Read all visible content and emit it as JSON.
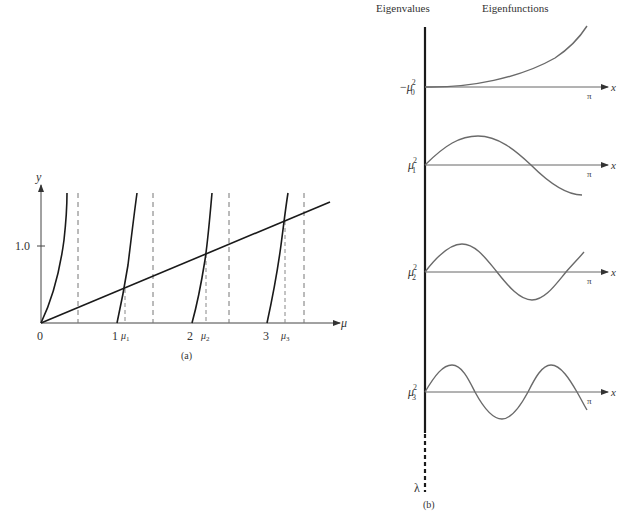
{
  "panel_a": {
    "caption": "(a)",
    "axis": {
      "x_label": "μ",
      "y_label": "y",
      "y_tick": "1.0"
    },
    "x_ticks": [
      "0",
      "1",
      "2",
      "3"
    ],
    "roots": [
      "μ1",
      "μ2",
      "μ3"
    ],
    "line_label": "y = μ/3 (straight line)",
    "curves": "y = tan(πμ) branches with vertical asymptotes at μ = 0.5, 1.5, 2.5, 3.5"
  },
  "panel_b": {
    "caption": "(b)",
    "header_eigenvalues": "Eigenvalues",
    "header_eigenfunctions": "Eigenfunctions",
    "axis_label_lambda": "λ",
    "rows": [
      {
        "eigenvalue": "−μ₀²",
        "base": "μ",
        "sub": "0",
        "neg": "−",
        "x_label": "x",
        "end_label": "π"
      },
      {
        "eigenvalue": "μ₁²",
        "base": "μ",
        "sub": "1",
        "neg": "",
        "x_label": "x",
        "end_label": "π"
      },
      {
        "eigenvalue": "μ₂²",
        "base": "μ",
        "sub": "2",
        "neg": "",
        "x_label": "x",
        "end_label": "π"
      },
      {
        "eigenvalue": "μ₃²",
        "base": "μ",
        "sub": "3",
        "neg": "",
        "x_label": "x",
        "end_label": "π"
      }
    ]
  },
  "colors": {
    "ink": "#1a1a1a",
    "curve": "#6a6a6a",
    "axis": "#555555",
    "dash": "#777777"
  }
}
